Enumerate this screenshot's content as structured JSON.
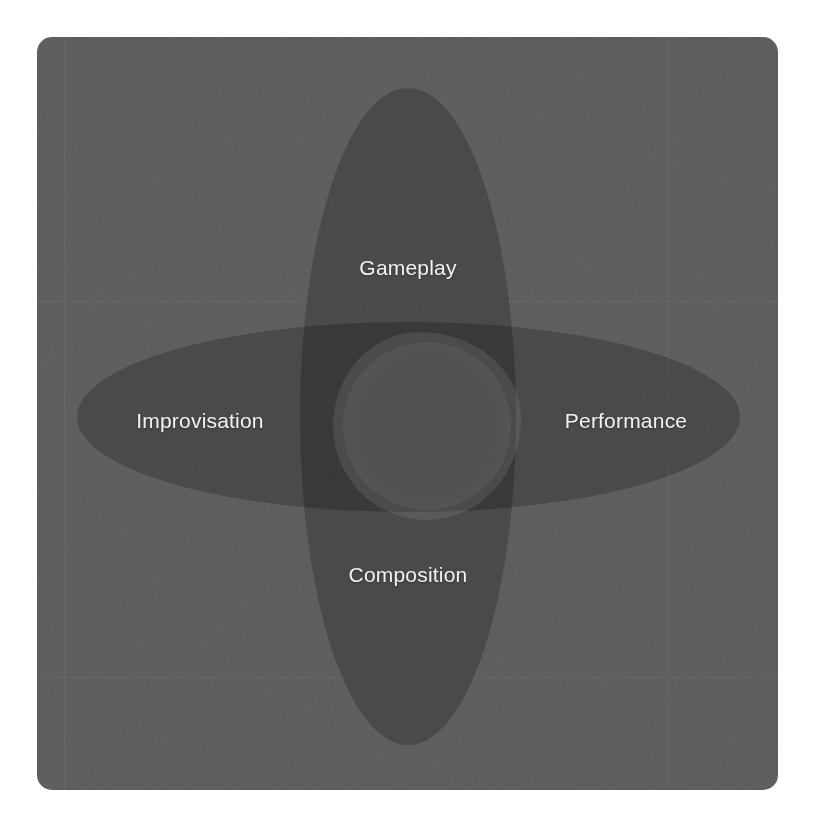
{
  "canvas": {
    "width": 815,
    "height": 824,
    "background_color": "#ffffff"
  },
  "card": {
    "background_color": "#5b5b5b",
    "corner_radius": 15
  },
  "diagram": {
    "type": "venn",
    "title": "",
    "petal_color": "#000000",
    "petal_opacity": 0.22,
    "intersection_color": "#6b6b6b",
    "label_color": "#f2f2f2",
    "sets": [
      {
        "id": "gameplay",
        "label": "Gameplay",
        "orientation": "vertical",
        "position": "top",
        "center_x": 408,
        "center_y": 268
      },
      {
        "id": "improvisation",
        "label": "Improvisation",
        "orientation": "horizontal",
        "position": "left",
        "center_x": 200,
        "center_y": 421
      },
      {
        "id": "performance",
        "label": "Performance",
        "orientation": "horizontal",
        "position": "right",
        "center_x": 626,
        "center_y": 421
      },
      {
        "id": "composition",
        "label": "Composition",
        "orientation": "vertical",
        "position": "bottom",
        "center_x": 408,
        "center_y": 575
      }
    ]
  }
}
